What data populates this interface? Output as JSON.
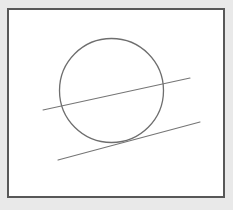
{
  "figure": {
    "title": "Circle with a secant line and a tangent line",
    "canvas": {
      "width": 233,
      "height": 210,
      "background_color": "#e9e9e9"
    },
    "frame": {
      "label": "drawing frame",
      "x": 8,
      "y": 9,
      "width": 216,
      "height": 188,
      "fill_color": "#ffffff",
      "stroke_color": "#585858",
      "stroke_width": 1.4
    },
    "shapes": {
      "circle": {
        "label": "circle",
        "cx": 111.5,
        "cy": 90.5,
        "r": 52,
        "stroke_color": "#6e6e6e",
        "stroke_width": 1.3,
        "fill": "none"
      },
      "secant_line": {
        "label": "secant line",
        "x1": 43,
        "y1": 110,
        "x2": 190,
        "y2": 78,
        "stroke_color": "#757575",
        "stroke_width": 1.1,
        "relation": "intersects circle at two points"
      },
      "tangent_line": {
        "label": "tangent line",
        "x1": 58,
        "y1": 160,
        "x2": 200,
        "y2": 122,
        "stroke_color": "#757575",
        "stroke_width": 1.1,
        "relation": "touches circle at one point"
      }
    }
  }
}
